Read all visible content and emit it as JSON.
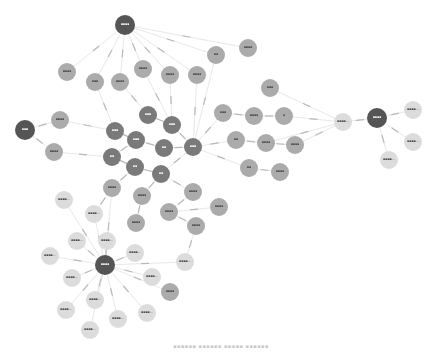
{
  "diagram": {
    "type": "force-directed-graph",
    "colors": {
      "hub": "#555555",
      "core": "#7a7a7a",
      "mid": "#ababab",
      "leaf": "#dcdcdc",
      "edge": "#d6d6d6",
      "edge_label": "#b8b8b8",
      "hub_text": "#ffffff",
      "node_text": "#444444"
    },
    "nodes": [
      {
        "id": "n0",
        "label": "▪▪▪▪",
        "x": 125,
        "y": 25,
        "r": 10,
        "tier": "hub"
      },
      {
        "id": "n1",
        "label": "▪▪▪",
        "x": 25,
        "y": 130,
        "r": 10,
        "tier": "hub"
      },
      {
        "id": "n2",
        "label": "▪▪▪▪",
        "x": 105,
        "y": 265,
        "r": 10,
        "tier": "hub"
      },
      {
        "id": "n3",
        "label": "▪▪▪▪",
        "x": 377,
        "y": 118,
        "r": 10,
        "tier": "hub"
      },
      {
        "id": "n4",
        "label": "▪▪▪",
        "x": 148,
        "y": 115,
        "r": 9,
        "tier": "core"
      },
      {
        "id": "n5",
        "label": "▪▪▪",
        "x": 115,
        "y": 131,
        "r": 9,
        "tier": "core"
      },
      {
        "id": "n6",
        "label": "▪▪▪",
        "x": 136,
        "y": 140,
        "r": 9,
        "tier": "core"
      },
      {
        "id": "n7",
        "label": "▪▪▪",
        "x": 172,
        "y": 125,
        "r": 9,
        "tier": "core"
      },
      {
        "id": "n8",
        "label": "▪▪",
        "x": 164,
        "y": 148,
        "r": 9,
        "tier": "core"
      },
      {
        "id": "n9",
        "label": "▪▪▪",
        "x": 193,
        "y": 147,
        "r": 9,
        "tier": "core"
      },
      {
        "id": "n10",
        "label": "▪▪",
        "x": 112,
        "y": 157,
        "r": 9,
        "tier": "core"
      },
      {
        "id": "n11",
        "label": "▪▪",
        "x": 135,
        "y": 167,
        "r": 9,
        "tier": "core"
      },
      {
        "id": "n12",
        "label": "▪▪",
        "x": 161,
        "y": 174,
        "r": 9,
        "tier": "core"
      },
      {
        "id": "n13",
        "label": "▪▪▪▪",
        "x": 67,
        "y": 72,
        "r": 9,
        "tier": "mid"
      },
      {
        "id": "n14",
        "label": "▪▪▪",
        "x": 95,
        "y": 82,
        "r": 9,
        "tier": "mid"
      },
      {
        "id": "n15",
        "label": "▪▪▪▪",
        "x": 120,
        "y": 82,
        "r": 9,
        "tier": "mid"
      },
      {
        "id": "n16",
        "label": "▪▪▪▪",
        "x": 143,
        "y": 69,
        "r": 9,
        "tier": "mid"
      },
      {
        "id": "n17",
        "label": "▪▪▪▪",
        "x": 170,
        "y": 75,
        "r": 9,
        "tier": "mid"
      },
      {
        "id": "n18",
        "label": "▪▪▪▪",
        "x": 197,
        "y": 75,
        "r": 9,
        "tier": "mid"
      },
      {
        "id": "n19",
        "label": "▪▪",
        "x": 216,
        "y": 55,
        "r": 9,
        "tier": "mid"
      },
      {
        "id": "n20",
        "label": "▪▪▪▪",
        "x": 248,
        "y": 48,
        "r": 9,
        "tier": "mid"
      },
      {
        "id": "n21",
        "label": "▪▪▪",
        "x": 270,
        "y": 88,
        "r": 9,
        "tier": "mid"
      },
      {
        "id": "n22",
        "label": "▪▪▪",
        "x": 223,
        "y": 113,
        "r": 9,
        "tier": "mid"
      },
      {
        "id": "n23",
        "label": "▪▪▪▪",
        "x": 254,
        "y": 116,
        "r": 9,
        "tier": "mid"
      },
      {
        "id": "n24",
        "label": "▪",
        "x": 284,
        "y": 116,
        "r": 9,
        "tier": "mid"
      },
      {
        "id": "n25",
        "label": "▪▪",
        "x": 236,
        "y": 140,
        "r": 9,
        "tier": "mid"
      },
      {
        "id": "n26",
        "label": "▪▪▪▪",
        "x": 266,
        "y": 143,
        "r": 9,
        "tier": "mid"
      },
      {
        "id": "n27",
        "label": "▪▪▪▪",
        "x": 295,
        "y": 145,
        "r": 9,
        "tier": "mid"
      },
      {
        "id": "n28",
        "label": "▪▪",
        "x": 249,
        "y": 168,
        "r": 9,
        "tier": "mid"
      },
      {
        "id": "n29",
        "label": "▪▪▪▪",
        "x": 280,
        "y": 172,
        "r": 9,
        "tier": "mid"
      },
      {
        "id": "n30",
        "label": "▪▪▪▪",
        "x": 60,
        "y": 120,
        "r": 9,
        "tier": "mid"
      },
      {
        "id": "n31",
        "label": "▪▪▪▪",
        "x": 54,
        "y": 152,
        "r": 9,
        "tier": "mid"
      },
      {
        "id": "n32",
        "label": "▪▪▪▪",
        "x": 112,
        "y": 188,
        "r": 9,
        "tier": "mid"
      },
      {
        "id": "n33",
        "label": "▪▪▪▪",
        "x": 142,
        "y": 196,
        "r": 9,
        "tier": "mid"
      },
      {
        "id": "n34",
        "label": "▪▪▪▪",
        "x": 193,
        "y": 192,
        "r": 9,
        "tier": "mid"
      },
      {
        "id": "n35",
        "label": "▪▪▪▪",
        "x": 169,
        "y": 212,
        "r": 9,
        "tier": "mid"
      },
      {
        "id": "n36",
        "label": "▪▪▪▪",
        "x": 136,
        "y": 223,
        "r": 9,
        "tier": "mid"
      },
      {
        "id": "n37",
        "label": "▪▪▪▪",
        "x": 196,
        "y": 226,
        "r": 9,
        "tier": "mid"
      },
      {
        "id": "n38",
        "label": "▪▪▪▪",
        "x": 219,
        "y": 207,
        "r": 9,
        "tier": "mid"
      },
      {
        "id": "n39",
        "label": "▪▪▪▪",
        "x": 170,
        "y": 292,
        "r": 9,
        "tier": "mid"
      },
      {
        "id": "n40",
        "label": "▪▪▪▪…",
        "x": 343,
        "y": 122,
        "r": 9,
        "tier": "leaf"
      },
      {
        "id": "n41",
        "label": "▪▪▪▪…",
        "x": 413,
        "y": 110,
        "r": 9,
        "tier": "leaf"
      },
      {
        "id": "n42",
        "label": "▪▪▪▪…",
        "x": 413,
        "y": 142,
        "r": 9,
        "tier": "leaf"
      },
      {
        "id": "n43",
        "label": "▪▪▪▪…",
        "x": 389,
        "y": 160,
        "r": 9,
        "tier": "leaf"
      },
      {
        "id": "n44",
        "label": "▪▪▪▪…",
        "x": 64,
        "y": 200,
        "r": 9,
        "tier": "leaf"
      },
      {
        "id": "n45",
        "label": "▪▪▪▪…",
        "x": 94,
        "y": 214,
        "r": 9,
        "tier": "leaf"
      },
      {
        "id": "n46",
        "label": "▪▪▪▪…",
        "x": 77,
        "y": 241,
        "r": 9,
        "tier": "leaf"
      },
      {
        "id": "n47",
        "label": "▪▪▪▪…",
        "x": 107,
        "y": 241,
        "r": 9,
        "tier": "leaf"
      },
      {
        "id": "n48",
        "label": "▪▪▪▪…",
        "x": 50,
        "y": 256,
        "r": 9,
        "tier": "leaf"
      },
      {
        "id": "n49",
        "label": "▪▪▪▪…",
        "x": 135,
        "y": 253,
        "r": 9,
        "tier": "leaf"
      },
      {
        "id": "n50",
        "label": "▪▪▪▪…",
        "x": 185,
        "y": 262,
        "r": 9,
        "tier": "leaf"
      },
      {
        "id": "n51",
        "label": "▪▪▪▪…",
        "x": 72,
        "y": 278,
        "r": 9,
        "tier": "leaf"
      },
      {
        "id": "n52",
        "label": "▪▪▪▪…",
        "x": 152,
        "y": 277,
        "r": 9,
        "tier": "leaf"
      },
      {
        "id": "n53",
        "label": "▪▪▪▪…",
        "x": 95,
        "y": 300,
        "r": 9,
        "tier": "leaf"
      },
      {
        "id": "n54",
        "label": "▪▪▪▪…",
        "x": 66,
        "y": 310,
        "r": 9,
        "tier": "leaf"
      },
      {
        "id": "n55",
        "label": "▪▪▪▪…",
        "x": 118,
        "y": 319,
        "r": 9,
        "tier": "leaf"
      },
      {
        "id": "n56",
        "label": "▪▪▪▪…",
        "x": 147,
        "y": 313,
        "r": 9,
        "tier": "leaf"
      },
      {
        "id": "n57",
        "label": "▪▪▪▪…",
        "x": 90,
        "y": 330,
        "r": 9,
        "tier": "leaf"
      }
    ],
    "edges": [
      [
        "n0",
        "n13"
      ],
      [
        "n0",
        "n14"
      ],
      [
        "n0",
        "n15"
      ],
      [
        "n0",
        "n16"
      ],
      [
        "n0",
        "n17"
      ],
      [
        "n0",
        "n18"
      ],
      [
        "n0",
        "n19"
      ],
      [
        "n0",
        "n20"
      ],
      [
        "n1",
        "n30"
      ],
      [
        "n1",
        "n31"
      ],
      [
        "n30",
        "n5"
      ],
      [
        "n31",
        "n10"
      ],
      [
        "n14",
        "n5"
      ],
      [
        "n15",
        "n4"
      ],
      [
        "n16",
        "n7"
      ],
      [
        "n17",
        "n7"
      ],
      [
        "n18",
        "n9"
      ],
      [
        "n19",
        "n9"
      ],
      [
        "n4",
        "n7"
      ],
      [
        "n5",
        "n6"
      ],
      [
        "n6",
        "n8"
      ],
      [
        "n7",
        "n9"
      ],
      [
        "n8",
        "n9"
      ],
      [
        "n10",
        "n11"
      ],
      [
        "n11",
        "n12"
      ],
      [
        "n9",
        "n12"
      ],
      [
        "n6",
        "n10"
      ],
      [
        "n9",
        "n22"
      ],
      [
        "n9",
        "n25"
      ],
      [
        "n9",
        "n28"
      ],
      [
        "n22",
        "n23"
      ],
      [
        "n23",
        "n24"
      ],
      [
        "n25",
        "n26"
      ],
      [
        "n26",
        "n27"
      ],
      [
        "n28",
        "n29"
      ],
      [
        "n21",
        "n40"
      ],
      [
        "n24",
        "n40"
      ],
      [
        "n27",
        "n40"
      ],
      [
        "n26",
        "n40"
      ],
      [
        "n40",
        "n3"
      ],
      [
        "n3",
        "n41"
      ],
      [
        "n3",
        "n42"
      ],
      [
        "n3",
        "n43"
      ],
      [
        "n11",
        "n32"
      ],
      [
        "n12",
        "n33"
      ],
      [
        "n12",
        "n34"
      ],
      [
        "n33",
        "n36"
      ],
      [
        "n34",
        "n35"
      ],
      [
        "n35",
        "n38"
      ],
      [
        "n35",
        "n37"
      ],
      [
        "n37",
        "n50"
      ],
      [
        "n32",
        "n45"
      ],
      [
        "n32",
        "n2"
      ],
      [
        "n2",
        "n44"
      ],
      [
        "n2",
        "n45"
      ],
      [
        "n2",
        "n46"
      ],
      [
        "n2",
        "n47"
      ],
      [
        "n2",
        "n48"
      ],
      [
        "n2",
        "n49"
      ],
      [
        "n2",
        "n50"
      ],
      [
        "n2",
        "n51"
      ],
      [
        "n2",
        "n52"
      ],
      [
        "n2",
        "n53"
      ],
      [
        "n2",
        "n54"
      ],
      [
        "n2",
        "n55"
      ],
      [
        "n2",
        "n56"
      ],
      [
        "n2",
        "n57"
      ],
      [
        "n2",
        "n39"
      ]
    ],
    "edge_label": "▪▪▪▪▪"
  },
  "caption": "▪▪▪▪▪▪ ▪▪▪▪▪▪ ▪▪▪▪▪ ▪▪▪▪▪▪"
}
